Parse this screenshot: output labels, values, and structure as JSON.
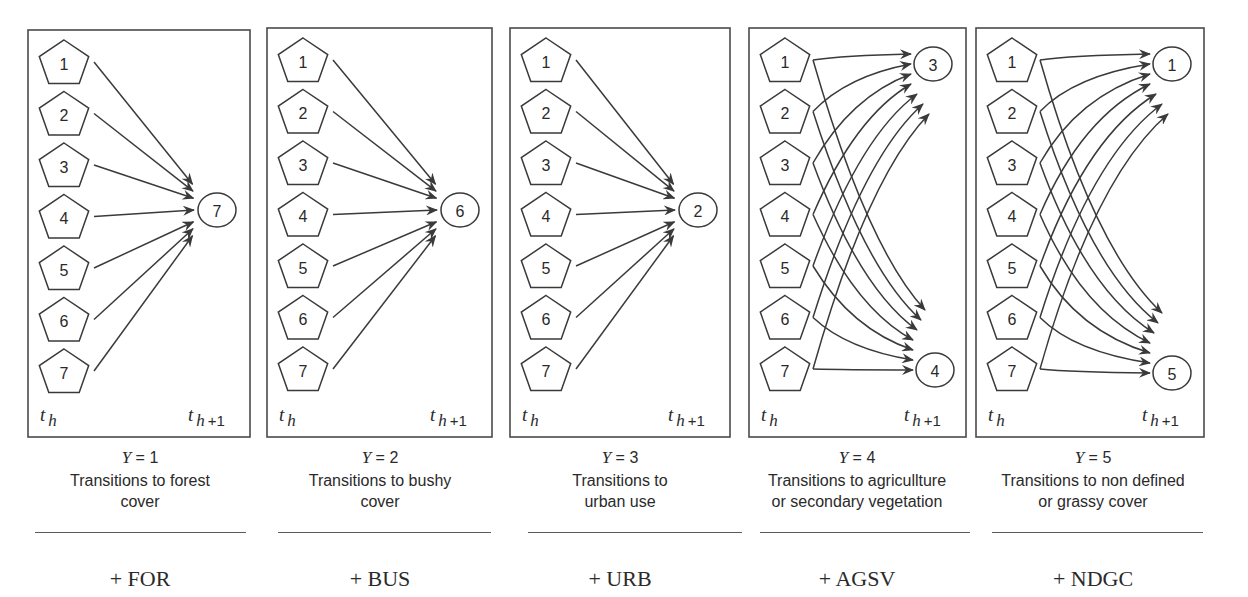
{
  "figure": {
    "colors": {
      "stroke": "#3a3a3a",
      "text": "#2a2a2a",
      "background": "#ffffff"
    },
    "time_labels": {
      "start_base": "t",
      "start_sub": "h",
      "end_base": "t",
      "end_sub": "h",
      "end_plus": "+1"
    },
    "source_nodes": [
      "1",
      "2",
      "3",
      "4",
      "5",
      "6",
      "7"
    ],
    "panels": [
      {
        "id": "for",
        "box": {
          "x": 28,
          "y": 30,
          "w": 222,
          "h": 407
        },
        "y_value": "1",
        "y_label": "Y",
        "description_lines": [
          "Transitions to forest",
          "cover"
        ],
        "code": "+ FOR",
        "kind": "fan_in",
        "targets": [
          {
            "label": "7",
            "cx": 217,
            "cy": 210
          }
        ],
        "caption_center": 140,
        "rule": {
          "x1": 35,
          "x2": 246
        }
      },
      {
        "id": "bus",
        "box": {
          "x": 267,
          "y": 28,
          "w": 225,
          "h": 409
        },
        "y_value": "2",
        "y_label": "Y",
        "description_lines": [
          "Transitions to bushy",
          "cover"
        ],
        "code": "+ BUS",
        "kind": "fan_in",
        "targets": [
          {
            "label": "6",
            "cx": 460,
            "cy": 210
          }
        ],
        "caption_center": 380,
        "rule": {
          "x1": 278,
          "x2": 491
        }
      },
      {
        "id": "urb",
        "box": {
          "x": 510,
          "y": 28,
          "w": 220,
          "h": 409
        },
        "y_value": "3",
        "y_label": "Y",
        "description_lines": [
          "Transitions to",
          "urban use"
        ],
        "code": "+ URB",
        "kind": "fan_in",
        "targets": [
          {
            "label": "2",
            "cx": 698,
            "cy": 210
          }
        ],
        "caption_center": 620,
        "rule": {
          "x1": 528,
          "x2": 742
        }
      },
      {
        "id": "agsv",
        "box": {
          "x": 749,
          "y": 28,
          "w": 217,
          "h": 409
        },
        "y_value": "4",
        "y_label": "Y",
        "description_lines": [
          "Transitions to agricullture",
          "or secondary vegetation"
        ],
        "code": "+ AGSV",
        "kind": "fan_split",
        "targets": [
          {
            "label": "3",
            "cx": 933,
            "cy": 64
          },
          {
            "label": "4",
            "cx": 935,
            "cy": 370
          }
        ],
        "caption_center": 857,
        "rule": {
          "x1": 760,
          "x2": 970
        }
      },
      {
        "id": "ndgc",
        "box": {
          "x": 976,
          "y": 28,
          "w": 228,
          "h": 409
        },
        "y_value": "5",
        "y_label": "Y",
        "description_lines": [
          "Transitions to non defined",
          "or grassy cover"
        ],
        "code": "+ NDGC",
        "kind": "fan_split",
        "targets": [
          {
            "label": "1",
            "cx": 1172,
            "cy": 64
          },
          {
            "label": "5",
            "cx": 1172,
            "cy": 373
          }
        ],
        "caption_center": 1093,
        "rule": {
          "x1": 992,
          "x2": 1203
        }
      }
    ]
  }
}
